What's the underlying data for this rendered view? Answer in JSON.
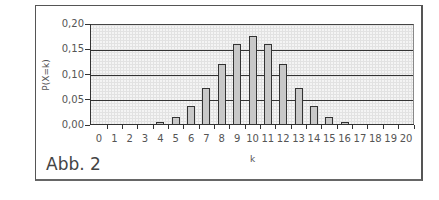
{
  "figure_label": "Abb. 2",
  "chart_data": {
    "type": "bar",
    "title": "",
    "xlabel": "k",
    "ylabel": "P(X=k)",
    "ylim": [
      0,
      0.2
    ],
    "yticks": [
      "0,00",
      "0,05",
      "0,10",
      "0,15",
      "0,20"
    ],
    "grid": true,
    "categories": [
      "0",
      "1",
      "2",
      "3",
      "4",
      "5",
      "6",
      "7",
      "8",
      "9",
      "10",
      "11",
      "12",
      "13",
      "14",
      "15",
      "16",
      "17",
      "18",
      "19",
      "20"
    ],
    "values": [
      0.0,
      0.0,
      0.0,
      0.001,
      0.005,
      0.015,
      0.037,
      0.074,
      0.12,
      0.16,
      0.176,
      0.16,
      0.12,
      0.074,
      0.037,
      0.015,
      0.005,
      0.001,
      0.0,
      0.0,
      0.0
    ]
  }
}
